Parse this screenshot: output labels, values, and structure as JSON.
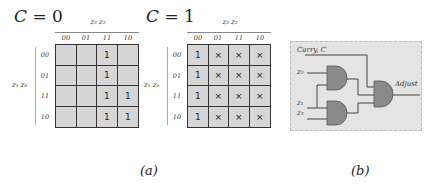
{
  "panel_a": {
    "maps": [
      {
        "title_var": "C",
        "title_eq": " = ",
        "title_val": "0",
        "col_var_label": "z₃ z₂",
        "row_var_label": "z₁ z₀",
        "col_labels": [
          "00",
          "01",
          "11",
          "10"
        ],
        "row_labels": [
          "00",
          "01",
          "11",
          "10"
        ],
        "cells": [
          [
            "",
            "",
            "1",
            ""
          ],
          [
            "",
            "",
            "1",
            ""
          ],
          [
            "",
            "",
            "1",
            "1"
          ],
          [
            "",
            "",
            "1",
            "1"
          ]
        ]
      },
      {
        "title_var": "C",
        "title_eq": " = ",
        "title_val": "1",
        "col_var_label": "z₃ z₂",
        "row_var_label": "z₁ z₀",
        "col_labels": [
          "00",
          "01",
          "11",
          "10"
        ],
        "row_labels": [
          "00",
          "01",
          "11",
          "10"
        ],
        "cells": [
          [
            "1",
            "×",
            "×",
            "×"
          ],
          [
            "1",
            "×",
            "×",
            "×"
          ],
          [
            "1",
            "×",
            "×",
            "×"
          ],
          [
            "1",
            "×",
            "×",
            "×"
          ]
        ]
      }
    ],
    "caption": "(a)"
  },
  "panel_b": {
    "carry_label": "Carry, C",
    "inputs": [
      "z₂",
      "z₁",
      "z₃"
    ],
    "output_label": "Adjust",
    "gates": [
      "and-gate",
      "and-gate",
      "and-gate"
    ],
    "colors": {
      "background": "#e4e4e4",
      "gate_fill": "#8a8a8a",
      "wire": "#444444"
    },
    "caption": "(b)"
  }
}
